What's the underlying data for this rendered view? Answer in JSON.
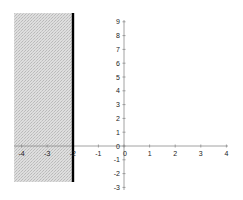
{
  "chart_data": {
    "type": "area",
    "title": "",
    "xlabel": "",
    "ylabel": "",
    "xlim": [
      -4,
      4
    ],
    "ylim": [
      -3,
      9
    ],
    "x_ticks": [
      -4,
      -3,
      -2,
      -1,
      0,
      1,
      2,
      3,
      4
    ],
    "y_ticks": [
      -3,
      -2,
      -1,
      0,
      1,
      2,
      3,
      4,
      5,
      6,
      7,
      8,
      9
    ],
    "grid": false,
    "legend": null,
    "boundary_line": {
      "x": -2,
      "style": "solid",
      "color": "#000000"
    },
    "shaded_region": {
      "x_from": -4,
      "x_to": -2,
      "y_from": -3,
      "y_to": 9,
      "color": "#d9d9d9",
      "pattern": "stipple"
    }
  },
  "labels": {
    "x": [
      "-4",
      "-3",
      "-2",
      "-1",
      "0",
      "1",
      "2",
      "3",
      "4"
    ],
    "y": [
      "9",
      "8",
      "7",
      "6",
      "5",
      "4",
      "3",
      "2",
      "1",
      "0",
      "-1",
      "-2",
      "-3"
    ]
  }
}
